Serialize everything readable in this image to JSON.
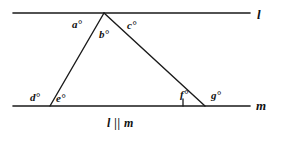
{
  "figure": {
    "caption": "l || m",
    "stroke_color": "#1a1a1a",
    "background_color": "#ffffff"
  },
  "lines": {
    "top": {
      "name": "l",
      "y": 13,
      "x_start": 13,
      "x_end": 250
    },
    "bottom": {
      "name": "m",
      "y": 106,
      "x_start": 13,
      "x_end": 250
    }
  },
  "triangle": {
    "apex": {
      "x": 104,
      "y": 13
    },
    "left_vertex": {
      "x": 50,
      "y": 106
    },
    "right_vertex": {
      "x": 205,
      "y": 106
    }
  },
  "tick_mark": {
    "x": 183,
    "y_top": 99,
    "y_bottom": 106
  },
  "angles": [
    {
      "id": "a",
      "label": "a°"
    },
    {
      "id": "b",
      "label": "b°"
    },
    {
      "id": "c",
      "label": "c°"
    },
    {
      "id": "d",
      "label": "d°"
    },
    {
      "id": "e",
      "label": "e°"
    },
    {
      "id": "f",
      "label": "f°"
    },
    {
      "id": "g",
      "label": "g°"
    }
  ]
}
